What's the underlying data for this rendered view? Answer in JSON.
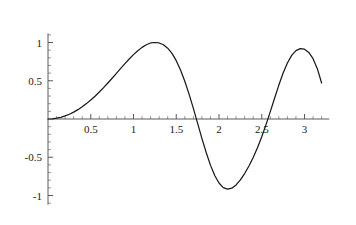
{
  "chart_data": {
    "type": "line",
    "title": "",
    "subtitle": "",
    "xlabel": "",
    "ylabel": "",
    "function": "sin(x^2)",
    "xlim": [
      0,
      3.22
    ],
    "ylim": [
      -1.12,
      1.12
    ],
    "grid": false,
    "legend": null,
    "x_ticks": [
      {
        "value": 0.5,
        "label": "0.5"
      },
      {
        "value": 1,
        "label": "1"
      },
      {
        "value": 1.5,
        "label": "1.5"
      },
      {
        "value": 2,
        "label": "2"
      },
      {
        "value": 2.5,
        "label": "2.5"
      },
      {
        "value": 3,
        "label": "3"
      }
    ],
    "y_ticks": [
      {
        "value": 1,
        "label": "1"
      },
      {
        "value": 0.5,
        "label": "0.5"
      },
      {
        "value": -0.5,
        "label": "-0.5"
      },
      {
        "value": -1,
        "label": "-1"
      }
    ],
    "x_minor_step": 0.1,
    "y_minor_step": 0.1,
    "series": [
      {
        "name": "sin(x^2)",
        "color": "#1a1a1a",
        "x": [
          0.0,
          0.05,
          0.1,
          0.15,
          0.2,
          0.25,
          0.3,
          0.35,
          0.4,
          0.45,
          0.5,
          0.55,
          0.6,
          0.65,
          0.7,
          0.75,
          0.8,
          0.85,
          0.9,
          0.95,
          1.0,
          1.05,
          1.1,
          1.15,
          1.2,
          1.25,
          1.3,
          1.35,
          1.4,
          1.45,
          1.5,
          1.55,
          1.6,
          1.65,
          1.7,
          1.75,
          1.8,
          1.85,
          1.9,
          1.95,
          2.0,
          2.05,
          2.1,
          2.15,
          2.2,
          2.25,
          2.3,
          2.35,
          2.4,
          2.45,
          2.5,
          2.55,
          2.6,
          2.65,
          2.7,
          2.75,
          2.8,
          2.85,
          2.9,
          2.95,
          3.0,
          3.05,
          3.1,
          3.15,
          3.2
        ],
        "y": [
          0.0,
          0.0025,
          0.01,
          0.0225,
          0.04,
          0.0625,
          0.0899,
          0.1222,
          0.1593,
          0.2011,
          0.2474,
          0.298,
          0.3523,
          0.4101,
          0.4706,
          0.5331,
          0.5969,
          0.6608,
          0.7238,
          0.7847,
          0.8415,
          0.8927,
          0.9364,
          0.9706,
          0.9937,
          1.0,
          0.9936,
          0.9702,
          0.9258,
          0.8573,
          0.7626,
          0.6411,
          0.4941,
          0.3249,
          0.1387,
          -0.0569,
          -0.2525,
          -0.438,
          -0.603,
          -0.738,
          -0.8367,
          -0.8962,
          -0.9172,
          -0.9037,
          -0.8615,
          -0.7964,
          -0.7132,
          -0.6148,
          -0.5022,
          -0.3749,
          -0.232,
          -0.0738,
          0.0963,
          0.2718,
          0.4435,
          0.6005,
          0.7323,
          0.831,
          0.8932,
          0.92,
          0.9129,
          0.8708,
          0.7884,
          0.6578,
          0.4707
        ]
      }
    ]
  },
  "axes": {
    "x_axis_name": "horizontal-axis",
    "y_axis_name": "vertical-axis"
  }
}
